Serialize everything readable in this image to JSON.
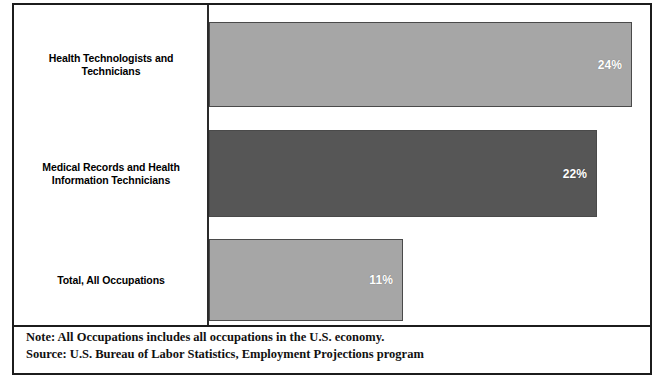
{
  "chart_data": {
    "type": "bar",
    "orientation": "horizontal",
    "title": "",
    "xlabel": "",
    "ylabel": "",
    "xlim": [
      0,
      25
    ],
    "grid": false,
    "legend": false,
    "categories": [
      "Health Technologists and Technicians",
      "Medical Records and Health Information Technicians",
      "Total, All Occupations"
    ],
    "values": [
      24,
      22,
      11
    ],
    "value_labels": [
      "24%",
      "22%",
      "11%"
    ],
    "bar_colors": [
      "#a6a6a6",
      "#565656",
      "#a6a6a6"
    ],
    "bars": [
      {
        "label_line1": "Health Technologists and",
        "label_line2": "Technicians",
        "value": 24,
        "value_label": "24%",
        "color": "#a6a6a6"
      },
      {
        "label_line1": "Medical Records and Health",
        "label_line2": "Information Technicians",
        "value": 22,
        "value_label": "22%",
        "color": "#565656"
      },
      {
        "label_line1": "Total, All Occupations",
        "label_line2": "",
        "value": 11,
        "value_label": "11%",
        "color": "#a6a6a6"
      }
    ],
    "annotations": [
      "Note: All Occupations includes all occupations in the U.S. economy.",
      "Source: U.S. Bureau of Labor Statistics, Employment Projections program"
    ]
  },
  "footer": {
    "note": "Note: All Occupations includes all occupations in the U.S. economy.",
    "source": "Source: U.S. Bureau of Labor Statistics, Employment Projections program"
  },
  "colors": {
    "frame": "#1c1c1c",
    "axis": "#2a2a2a",
    "bar_light": "#a6a6a6",
    "bar_dark": "#565656",
    "value_text": "#ffffff",
    "label_text": "#000000"
  }
}
